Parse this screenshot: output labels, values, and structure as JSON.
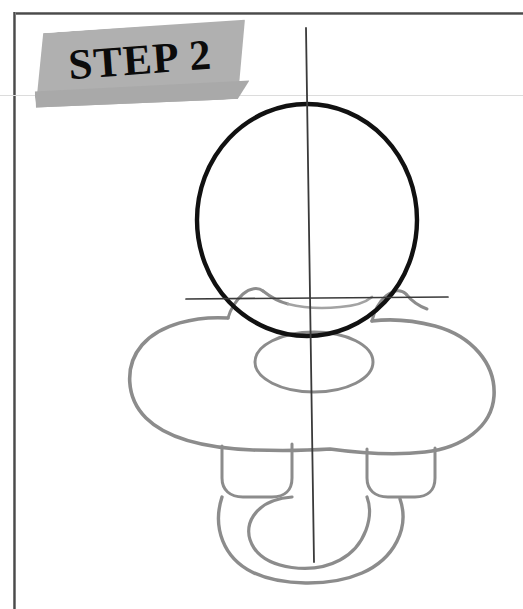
{
  "page": {
    "width": 523,
    "height": 609,
    "background_color": "#ffffff",
    "border_color": "#4a4a4a",
    "type": "drawing-tutorial-page"
  },
  "banner": {
    "label": "STEP 2",
    "fill_color": "#b0b0b0",
    "shade_color": "#a9a9a9",
    "text_color": "#0b0b0b",
    "rotation_degrees": -4.2
  },
  "drawing": {
    "subject": "pacifier",
    "step_number": 2,
    "new_stroke_color": "#111111",
    "previous_stroke_color": "#8c8c8c",
    "guide_line_color": "#3a3a3a",
    "elements": [
      {
        "name": "head-circle",
        "role": "new-construction-shape",
        "shape": "ellipse",
        "cx": 307,
        "cy": 220,
        "rx": 110,
        "ry": 116,
        "stroke": "#111111",
        "stroke_width": 4.2
      },
      {
        "name": "vertical-center-guideline",
        "role": "guideline",
        "shape": "line",
        "x1": 306,
        "y1": 28,
        "x2": 314,
        "y2": 562,
        "stroke": "#3a3a3a",
        "stroke_width": 1.6
      },
      {
        "name": "horizontal-center-guideline",
        "role": "guideline",
        "shape": "line",
        "x1": 186,
        "y1": 299,
        "x2": 448,
        "y2": 297,
        "stroke": "#3a3a3a",
        "stroke_width": 1.6
      },
      {
        "name": "pacifier-guard-shield",
        "role": "previous-step-shape",
        "shape": "butterfly-outline",
        "stroke": "#8c8c8c",
        "stroke_width": 3.4
      },
      {
        "name": "pacifier-guard-inner-ellipse",
        "role": "previous-step-shape",
        "shape": "ellipse",
        "cx": 314,
        "cy": 362,
        "rx": 59,
        "ry": 30,
        "stroke": "#8c8c8c",
        "stroke_width": 3
      },
      {
        "name": "left-handle-tab",
        "role": "previous-step-shape",
        "shape": "rounded-rect",
        "stroke": "#8c8c8c",
        "stroke_width": 3
      },
      {
        "name": "right-handle-tab",
        "role": "previous-step-shape",
        "shape": "rounded-rect",
        "stroke": "#8c8c8c",
        "stroke_width": 3
      },
      {
        "name": "pacifier-handle-ring",
        "role": "previous-step-shape",
        "shape": "u-band",
        "stroke": "#8c8c8c",
        "stroke_width": 3.4
      },
      {
        "name": "guard-notch-left",
        "role": "previous-step-shape",
        "shape": "curve",
        "stroke": "#8c8c8c",
        "stroke_width": 3
      },
      {
        "name": "guard-notch-right",
        "role": "previous-step-shape",
        "shape": "curve",
        "stroke": "#8c8c8c",
        "stroke_width": 3
      }
    ]
  }
}
